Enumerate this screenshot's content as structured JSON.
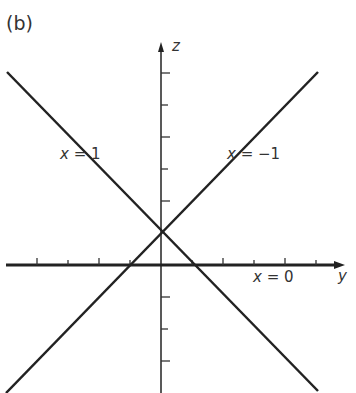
{
  "panel_label": "(b)",
  "axes": {
    "z_label": "z",
    "y_label": "y"
  },
  "lines": [
    {
      "label": "x = 1",
      "var": "x",
      "eq": " = 1"
    },
    {
      "label": "x = −1",
      "var": "x",
      "eq": " = −1"
    },
    {
      "label": "x = 0",
      "var": "x",
      "eq": " = 0"
    }
  ],
  "colors": {
    "line": "#222222",
    "text": "#333333"
  }
}
